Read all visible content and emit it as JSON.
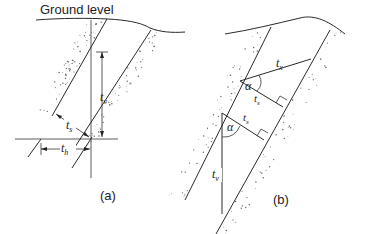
{
  "diagram": {
    "ground_label": "Ground level",
    "panel_a": {
      "caption": "(a)",
      "labels": {
        "vertical": "t",
        "vertical_sub": "v",
        "true": "t",
        "true_sub": "s",
        "horizontal": "t",
        "horizontal_sub": "h"
      }
    },
    "panel_b": {
      "caption": "(b)",
      "labels": {
        "apparent_x": "t",
        "apparent_x_sub": "x",
        "true_upper": "t",
        "true_upper_sub": "s",
        "true_lower": "t",
        "true_lower_sub": "s",
        "vertical": "t",
        "vertical_sub": "v",
        "angle_upper": "α",
        "angle_lower": "α"
      }
    }
  }
}
